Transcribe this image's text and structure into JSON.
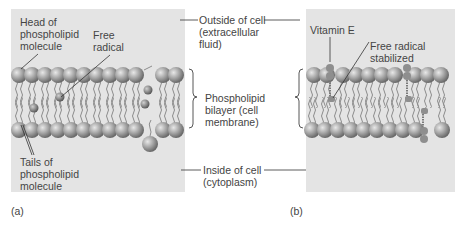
{
  "panel_a": {
    "tag": "(a)",
    "labels": {
      "head": "Head of\nphospholipid\nmolecule",
      "free_radical": "Free\nradical",
      "tails": "Tails of\nphospholipid\nmolecule"
    }
  },
  "panel_b": {
    "tag": "(b)",
    "labels": {
      "vitamin_e": "Vitamin E",
      "free_radical_stabilized": "Free radical\nstabilized"
    }
  },
  "center": {
    "outside": "Outside of cell\n(extracellular\nfluid)",
    "bilayer": "Phospholipid\nbilayer (cell\nmembrane)",
    "inside": "Inside of cell\n(cytoplasm)"
  },
  "colors": {
    "panel_bg": "#e4e4e4",
    "head": "#9a9a9a",
    "tail": "#8c8c8c",
    "leader_line": "#333333"
  }
}
